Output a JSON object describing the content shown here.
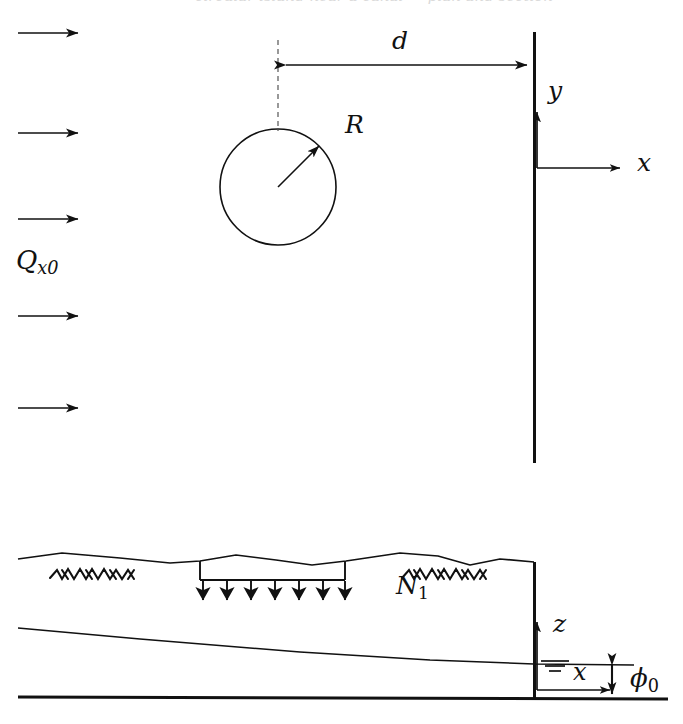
{
  "figure": {
    "background_color": "#ffffff",
    "ink_color": "#111111",
    "width": 683,
    "height": 724,
    "clipped_caption": "circular island near a canal — plan and section"
  },
  "plan_view": {
    "name": "plan-view",
    "inflow": {
      "label": "Q",
      "label_sub": "x0",
      "description": "uniform regional flow entering from the left",
      "arrow_count": 5,
      "arrow_y_positions": [
        33,
        133,
        219,
        316,
        408
      ],
      "arrow_x_start": 18,
      "arrow_x_end": 82
    },
    "island": {
      "label": "R",
      "description": "circular island / recharge disc",
      "center_x": 278,
      "center_y": 187,
      "radius": 58,
      "radius_arrow_angle_deg": 45
    },
    "distance": {
      "label": "d",
      "description": "distance from island center to the boundary",
      "y": 65,
      "x_start": 278,
      "x_end": 534
    },
    "boundary_wall": {
      "name": "fixed-head boundary",
      "x": 534,
      "y_top": 32,
      "y_bottom": 463
    },
    "axes": {
      "origin_x": 534,
      "origin_y": 168,
      "vertical_label": "y",
      "horizontal_label": "x",
      "vertical_length": 62,
      "horizontal_length": 92
    }
  },
  "cross_section": {
    "name": "cross-section-view",
    "ground_surface": "irregular land surface with vegetation hatching",
    "vegetation_marks": [
      {
        "x": 52,
        "y": 572
      },
      {
        "x": 404,
        "y": 572
      }
    ],
    "recharge": {
      "label": "N",
      "label_sub": "1",
      "description": "distributed recharge applied over a strip of the land surface",
      "bar_x_start": 200,
      "bar_x_end": 345,
      "bar_y": 580,
      "arrow_count": 7,
      "arrow_length": 33
    },
    "water_table": {
      "description": "phreatic surface sloping gently down to the right",
      "left_y": 628,
      "right_y": 664
    },
    "impermeable_base": {
      "description": "horizontal impervious base of the aquifer",
      "y": 698
    },
    "right_boundary": {
      "x": 534,
      "y_top": 562,
      "y_bottom": 698
    },
    "axes": {
      "origin_x": 534,
      "origin_y": 690,
      "vertical_label": "z",
      "horizontal_label": "x",
      "vertical_length": 70,
      "horizontal_length": 80,
      "water_table_symbol": "three-stacked-lines"
    },
    "head": {
      "label": "ϕ",
      "label_sub": "0",
      "description": "prescribed head above the impermeable base at the boundary",
      "x": 608,
      "y_top": 660,
      "y_bottom": 698
    }
  }
}
